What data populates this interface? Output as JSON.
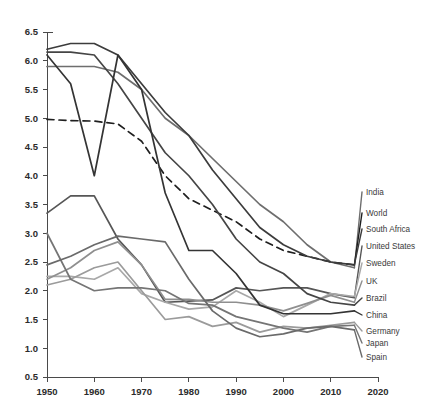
{
  "title_strip": "",
  "chart_data": {
    "type": "line",
    "title": "",
    "subtitle": "",
    "xlabel": "",
    "ylabel": "",
    "xlim": [
      1950,
      2020
    ],
    "ylim": [
      0.5,
      6.5
    ],
    "xticks": [
      "1950",
      "1960",
      "1970",
      "1980",
      "1990",
      "2000",
      "2010",
      "2020"
    ],
    "yticks": [
      "0.5",
      "1.0",
      "1.5",
      "2.0",
      "2.5",
      "3.0",
      "3.5",
      "4.0",
      "4.5",
      "5.0",
      "5.5",
      "6.0",
      "6.5"
    ],
    "grid": false,
    "legend_position": "right",
    "x": [
      1950,
      1955,
      1960,
      1965,
      1970,
      1975,
      1980,
      1985,
      1990,
      1995,
      2000,
      2005,
      2010,
      2015
    ],
    "series": [
      {
        "name": "India",
        "color": "#6e6e6e",
        "dash": "none",
        "values": [
          5.9,
          5.9,
          5.9,
          5.8,
          5.5,
          5.0,
          4.7,
          4.3,
          3.9,
          3.5,
          3.2,
          2.8,
          2.5,
          2.4
        ]
      },
      {
        "name": "World",
        "color": "#1f1f1f",
        "dash": "dashed",
        "values": [
          4.98,
          4.96,
          4.95,
          4.9,
          4.6,
          4.0,
          3.6,
          3.4,
          3.2,
          2.9,
          2.7,
          2.6,
          2.5,
          2.45
        ]
      },
      {
        "name": "South Africa",
        "color": "#3c3c3c",
        "dash": "none",
        "values": [
          6.2,
          6.3,
          6.3,
          6.1,
          5.6,
          5.1,
          4.7,
          4.1,
          3.6,
          3.1,
          2.8,
          2.6,
          2.5,
          2.45
        ]
      },
      {
        "name": "United States",
        "color": "#565656",
        "dash": "none",
        "values": [
          3.35,
          3.65,
          3.65,
          2.9,
          2.45,
          1.8,
          1.82,
          1.84,
          2.05,
          2.0,
          2.05,
          2.05,
          1.95,
          1.88
        ]
      },
      {
        "name": "Sweden",
        "color": "#a8a8a8",
        "dash": "none",
        "values": [
          2.25,
          2.25,
          2.2,
          2.4,
          1.95,
          1.8,
          1.68,
          1.72,
          2.0,
          1.8,
          1.55,
          1.75,
          1.95,
          1.9
        ]
      },
      {
        "name": "UK",
        "color": "#8f8f8f",
        "dash": "none",
        "values": [
          2.2,
          2.4,
          2.7,
          2.85,
          2.45,
          1.85,
          1.85,
          1.8,
          1.8,
          1.75,
          1.65,
          1.78,
          1.92,
          1.8
        ]
      },
      {
        "name": "Brazil",
        "color": "#454545",
        "dash": "none",
        "values": [
          6.15,
          6.15,
          6.1,
          5.6,
          5.0,
          4.4,
          4.0,
          3.5,
          2.9,
          2.5,
          2.3,
          1.95,
          1.8,
          1.75
        ]
      },
      {
        "name": "China",
        "color": "#343434",
        "dash": "none",
        "values": [
          6.1,
          5.6,
          4.0,
          6.1,
          5.5,
          3.7,
          2.7,
          2.7,
          2.3,
          1.75,
          1.6,
          1.6,
          1.6,
          1.65
        ]
      },
      {
        "name": "Germany",
        "color": "#9b9b9b",
        "dash": "none",
        "values": [
          2.1,
          2.2,
          2.4,
          2.5,
          2.0,
          1.5,
          1.55,
          1.38,
          1.45,
          1.28,
          1.38,
          1.35,
          1.4,
          1.45
        ]
      },
      {
        "name": "Japan",
        "color": "#757575",
        "dash": "none",
        "values": [
          3.0,
          2.2,
          2.0,
          2.05,
          2.05,
          2.0,
          1.78,
          1.75,
          1.55,
          1.45,
          1.35,
          1.28,
          1.38,
          1.4
        ]
      },
      {
        "name": "Spain",
        "color": "#6a6a6a",
        "dash": "none",
        "values": [
          2.45,
          2.6,
          2.8,
          2.95,
          2.9,
          2.85,
          2.2,
          1.65,
          1.35,
          1.2,
          1.25,
          1.35,
          1.38,
          1.32
        ]
      }
    ]
  },
  "legend": {
    "items": [
      {
        "label": "India",
        "y": 192
      },
      {
        "label": "World",
        "y": 213
      },
      {
        "label": "South Africa",
        "y": 229
      },
      {
        "label": "United States",
        "y": 246
      },
      {
        "label": "Sweden",
        "y": 263
      },
      {
        "label": "UK",
        "y": 281
      },
      {
        "label": "Brazil",
        "y": 298
      },
      {
        "label": "China",
        "y": 315
      },
      {
        "label": "Germany",
        "y": 331
      },
      {
        "label": "Japan",
        "y": 343
      },
      {
        "label": "Spain",
        "y": 357
      }
    ]
  }
}
